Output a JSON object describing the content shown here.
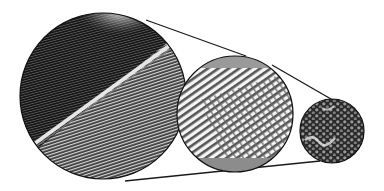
{
  "figure": {
    "panels": [
      {
        "id": "feather-vane",
        "label": "feather shaft and barbs",
        "cx": 103,
        "cy": 96,
        "r": 83
      },
      {
        "id": "barbules",
        "label": "interlocking barbules",
        "cx": 235,
        "cy": 114,
        "r": 58
      },
      {
        "id": "cells",
        "label": "cellular structure",
        "cx": 332,
        "cy": 131,
        "r": 32
      }
    ],
    "connectors": [
      {
        "from": "feather-vane",
        "to": "barbules",
        "x1": 146,
        "y1": 20,
        "x2": 246,
        "y2": 56
      },
      {
        "from": "feather-vane",
        "to": "cells",
        "x1": 125,
        "y1": 181,
        "x2": 320,
        "y2": 161
      },
      {
        "from": "barbules",
        "to": "cells",
        "x1": 272,
        "y1": 65,
        "x2": 331,
        "y2": 99
      }
    ],
    "colors": {
      "background": "#ffffff",
      "ink": "#1a1a1a",
      "dark_fill": "#202020",
      "mid_gray": "#8a8a8a",
      "light_gray": "#cfcfcf"
    }
  }
}
